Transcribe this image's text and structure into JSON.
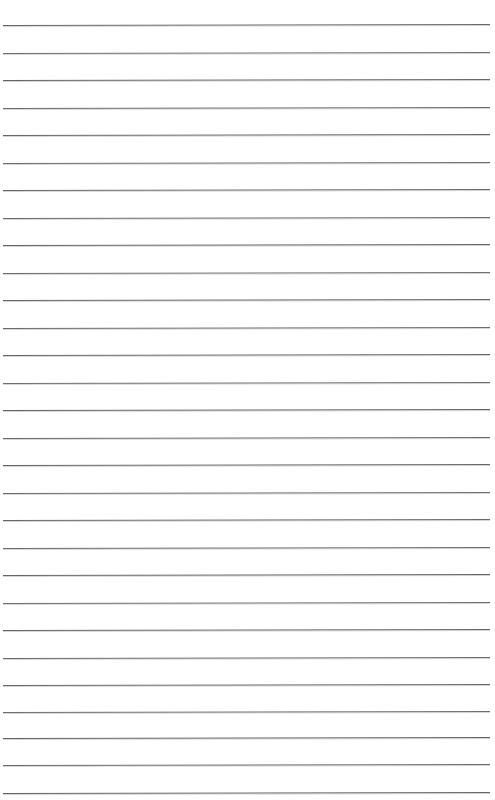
{
  "document": {
    "kind": "lined-paper-scan",
    "title": "Blank ruled notepad page",
    "description": "Scanned sheet of blank lined writing paper with no handwriting or printed text",
    "page_width": 495,
    "page_height": 800,
    "background_color": "#ffffff",
    "has_text_content": false,
    "visible_text": ""
  },
  "ruling": {
    "line_color": "#5a5d60",
    "line_count": 29,
    "first_line_y": 25,
    "line_spacing": 27.4,
    "line_left_x": 3,
    "line_right_x": 490,
    "skew_degrees": -0.12,
    "top_margin": 25,
    "bottom_margin": 7,
    "left_margin": 3,
    "right_margin": 5,
    "lines": [
      {
        "index": 1,
        "y": 25,
        "x1": 3,
        "x2": 490,
        "thickness": 1.6,
        "opacity": 0.92
      },
      {
        "index": 2,
        "y": 53,
        "x1": 3,
        "x2": 490,
        "thickness": 1.5,
        "opacity": 0.88
      },
      {
        "index": 3,
        "y": 80,
        "x1": 3,
        "x2": 490,
        "thickness": 1.6,
        "opacity": 0.94
      },
      {
        "index": 4,
        "y": 108,
        "x1": 3,
        "x2": 490,
        "thickness": 1.5,
        "opacity": 0.9
      },
      {
        "index": 5,
        "y": 135,
        "x1": 3,
        "x2": 490,
        "thickness": 1.6,
        "opacity": 0.93
      },
      {
        "index": 6,
        "y": 163,
        "x1": 3,
        "x2": 490,
        "thickness": 1.5,
        "opacity": 0.89
      },
      {
        "index": 7,
        "y": 190,
        "x1": 3,
        "x2": 490,
        "thickness": 1.6,
        "opacity": 0.92
      },
      {
        "index": 8,
        "y": 218,
        "x1": 3,
        "x2": 490,
        "thickness": 1.5,
        "opacity": 0.9
      },
      {
        "index": 9,
        "y": 245,
        "x1": 3,
        "x2": 490,
        "thickness": 1.6,
        "opacity": 0.94
      },
      {
        "index": 10,
        "y": 273,
        "x1": 3,
        "x2": 490,
        "thickness": 1.5,
        "opacity": 0.88
      },
      {
        "index": 11,
        "y": 300,
        "x1": 3,
        "x2": 490,
        "thickness": 1.6,
        "opacity": 0.93
      },
      {
        "index": 12,
        "y": 328,
        "x1": 3,
        "x2": 490,
        "thickness": 1.5,
        "opacity": 0.9
      },
      {
        "index": 13,
        "y": 355,
        "x1": 3,
        "x2": 490,
        "thickness": 1.6,
        "opacity": 0.92
      },
      {
        "index": 14,
        "y": 383,
        "x1": 3,
        "x2": 490,
        "thickness": 1.5,
        "opacity": 0.89
      },
      {
        "index": 15,
        "y": 410,
        "x1": 3,
        "x2": 490,
        "thickness": 1.6,
        "opacity": 0.94
      },
      {
        "index": 16,
        "y": 438,
        "x1": 3,
        "x2": 490,
        "thickness": 1.5,
        "opacity": 0.91
      },
      {
        "index": 17,
        "y": 465,
        "x1": 3,
        "x2": 490,
        "thickness": 1.6,
        "opacity": 0.93
      },
      {
        "index": 18,
        "y": 493,
        "x1": 3,
        "x2": 490,
        "thickness": 1.5,
        "opacity": 0.89
      },
      {
        "index": 19,
        "y": 520,
        "x1": 3,
        "x2": 490,
        "thickness": 1.6,
        "opacity": 0.92
      },
      {
        "index": 20,
        "y": 548,
        "x1": 3,
        "x2": 490,
        "thickness": 1.5,
        "opacity": 0.9
      },
      {
        "index": 21,
        "y": 575,
        "x1": 3,
        "x2": 490,
        "thickness": 1.6,
        "opacity": 0.94
      },
      {
        "index": 22,
        "y": 603,
        "x1": 3,
        "x2": 490,
        "thickness": 1.5,
        "opacity": 0.88
      },
      {
        "index": 23,
        "y": 630,
        "x1": 3,
        "x2": 490,
        "thickness": 1.6,
        "opacity": 0.93
      },
      {
        "index": 24,
        "y": 658,
        "x1": 3,
        "x2": 490,
        "thickness": 1.5,
        "opacity": 0.9
      },
      {
        "index": 25,
        "y": 685,
        "x1": 3,
        "x2": 490,
        "thickness": 1.6,
        "opacity": 0.92
      },
      {
        "index": 26,
        "y": 712,
        "x1": 3,
        "x2": 490,
        "thickness": 1.5,
        "opacity": 0.89
      },
      {
        "index": 27,
        "y": 738,
        "x1": 3,
        "x2": 490,
        "thickness": 1.6,
        "opacity": 0.94
      },
      {
        "index": 28,
        "y": 765,
        "x1": 3,
        "x2": 490,
        "thickness": 1.5,
        "opacity": 0.91
      },
      {
        "index": 29,
        "y": 793,
        "x1": 3,
        "x2": 490,
        "thickness": 1.6,
        "opacity": 0.93
      }
    ]
  }
}
